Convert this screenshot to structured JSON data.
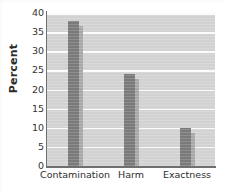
{
  "chart_data": {
    "type": "bar",
    "title": "",
    "subtitle": "",
    "xlabel": "",
    "ylabel": "Percent",
    "categories": [
      "Contamination",
      "Harm",
      "Exactness"
    ],
    "values": [
      38,
      24,
      10
    ],
    "ylim": [
      0,
      40
    ],
    "ytick_step": 5,
    "yticks": [
      0,
      5,
      10,
      15,
      20,
      25,
      30,
      35,
      40
    ],
    "ytick_labels": [
      "0",
      "5",
      "10",
      "15",
      "20",
      "25",
      "30",
      "35",
      "40"
    ],
    "grid": true,
    "grid_axis": "y",
    "grid_color": "#fbfbfb",
    "legend": false,
    "legend_position": "none",
    "orientation": "vertical",
    "series": [
      {
        "name": "Percent",
        "values": [
          38,
          24,
          10
        ]
      }
    ],
    "annotations": []
  },
  "style": {
    "plot_background": "#d2d2d2",
    "page_background": "#ffffff",
    "bar_color": "#7a7a7a",
    "bar_shadow_color": "#a8a8a8",
    "axis_color": "#6f6f6f",
    "text_color": "#2e2e2e"
  }
}
